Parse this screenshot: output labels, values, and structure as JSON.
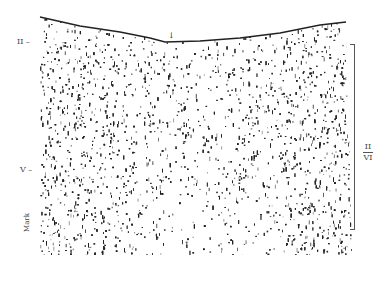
{
  "figure": {
    "type": "histology-micrograph",
    "ink_color": "#222222",
    "background_color": "#ffffff",
    "left_labels": [
      {
        "id": "layer-ii",
        "text": "II –"
      },
      {
        "id": "layer-v",
        "text": "V –"
      },
      {
        "id": "mark",
        "text": "Mark"
      }
    ],
    "right_bracket": {
      "top_text": "II",
      "bottom_text": "VI"
    },
    "arrows": [
      {
        "id": "top-arrow",
        "glyph": "↓"
      },
      {
        "id": "bottom-arrow",
        "glyph": "↑"
      }
    ]
  }
}
